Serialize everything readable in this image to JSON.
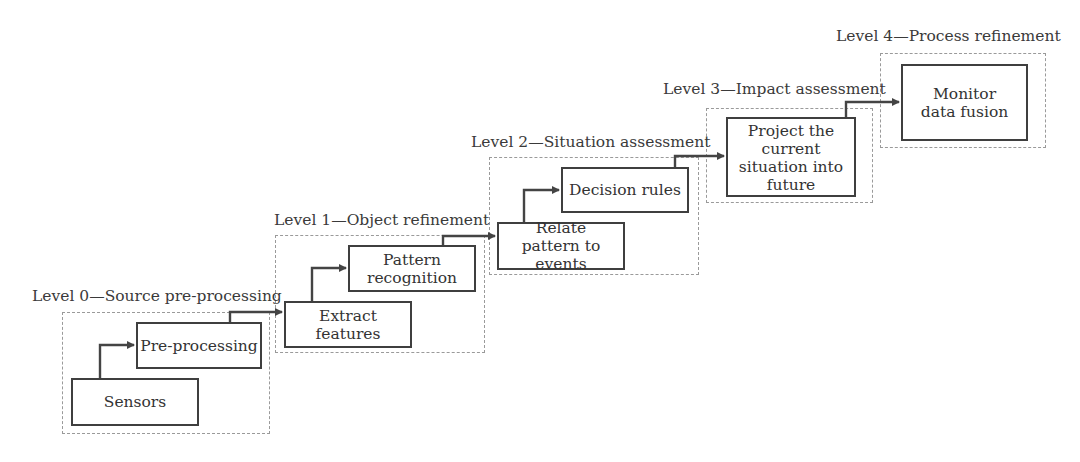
{
  "diagram": {
    "type": "data-fusion-levels-staircase",
    "levels": [
      {
        "label": "Level 0—Source pre-processing",
        "steps": [
          "Sensors",
          "Pre-processing"
        ]
      },
      {
        "label": "Level 1—Object refinement",
        "steps": [
          "Extract features",
          "Pattern recognition"
        ]
      },
      {
        "label": "Level 2—Situation assessment",
        "steps": [
          "Relate pattern to events",
          "Decision rules"
        ]
      },
      {
        "label": "Level 3—Impact assessment",
        "steps": [
          "Project the current situation into future"
        ]
      },
      {
        "label": "Level 4—Process refinement",
        "steps": [
          "Monitor data fusion"
        ]
      }
    ],
    "flow": [
      [
        "Sensors",
        "Pre-processing"
      ],
      [
        "Pre-processing",
        "Extract features"
      ],
      [
        "Extract features",
        "Pattern recognition"
      ],
      [
        "Pattern recognition",
        "Relate pattern to events"
      ],
      [
        "Relate pattern to events",
        "Decision rules"
      ],
      [
        "Decision rules",
        "Project the current situation into future"
      ],
      [
        "Project the current situation into future",
        "Monitor data fusion"
      ]
    ],
    "colors": {
      "box_border": "#3f3f3f",
      "frame_border": "#9a9a9a",
      "arrow": "#444444",
      "text": "#3a3a3a"
    }
  }
}
